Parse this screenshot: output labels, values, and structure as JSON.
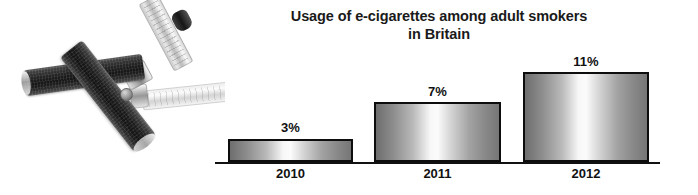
{
  "chart_data": {
    "type": "bar",
    "title": "Usage of e-cigarettes among adult smokers in Britain",
    "title_lines": [
      "Usage of e-cigarettes among adult smokers",
      "in Britain"
    ],
    "categories": [
      "2010",
      "2011",
      "2012"
    ],
    "values": [
      3,
      7,
      11
    ],
    "value_labels": [
      "3%",
      "7%",
      "11%"
    ],
    "xlabel": "",
    "ylabel": "",
    "ylim": [
      0,
      12
    ],
    "grid": false,
    "legend": false,
    "colors": {
      "bar_fill_light": "#fbfbfb",
      "bar_fill_dark": "#6e6e6e",
      "bar_border": "#0d0d0d",
      "axis": "#111111",
      "text": "#111111",
      "background": "#ffffff"
    }
  },
  "photo": {
    "alt": "two crossed black e-cigarettes with metallic bands and clear tanks",
    "icon": "ecigarette-photo"
  }
}
